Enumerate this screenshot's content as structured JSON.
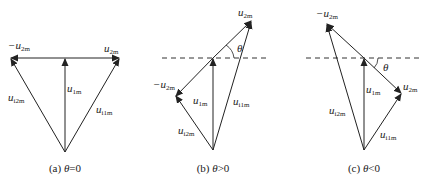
{
  "figure": {
    "panels": [
      {
        "id": "a",
        "caption_prefix": "(a) ",
        "caption_theta": "θ",
        "caption_relation": "=0",
        "labels": {
          "neg_u2m_sign": "−",
          "u": "u",
          "sub_2m": "2m",
          "sub_1m": "1m",
          "sub_i2m": "i2m",
          "sub_i1m": "i1m"
        }
      },
      {
        "id": "b",
        "caption_prefix": "(b) ",
        "caption_theta": "θ",
        "caption_relation": ">0",
        "theta_label": "θ",
        "labels": {
          "neg_u2m_sign": "−",
          "u": "u",
          "sub_2m": "2m",
          "sub_1m": "1m",
          "sub_i2m": "i2m",
          "sub_i1m": "i1m"
        }
      },
      {
        "id": "c",
        "caption_prefix": "(c) ",
        "caption_theta": "θ",
        "caption_relation": "<0",
        "theta_label": "θ",
        "labels": {
          "neg_u2m_sign": "−",
          "u": "u",
          "sub_2m": "2m",
          "sub_1m": "1m",
          "sub_i2m": "i2m",
          "sub_i1m": "i1m"
        }
      }
    ],
    "colors": {
      "stroke": "#222222",
      "background": "#ffffff"
    }
  }
}
